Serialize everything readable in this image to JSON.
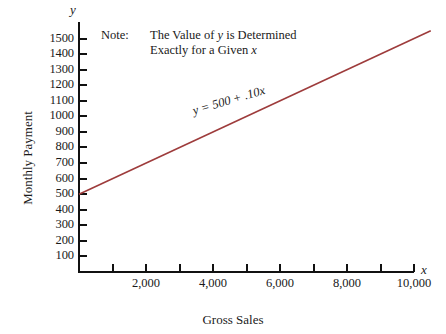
{
  "chart_data": {
    "type": "line",
    "title": "",
    "xlabel": "Gross Sales",
    "ylabel": "Monthly Payment",
    "x_variable": "x",
    "y_variable": "y",
    "xlim": [
      0,
      11000
    ],
    "ylim": [
      0,
      1550
    ],
    "grid": false,
    "legend": "none",
    "x_ticks": [
      1000,
      2000,
      3000,
      4000,
      5000,
      6000,
      7000,
      8000,
      9000,
      10000
    ],
    "x_tick_labels": [
      "",
      "2,000",
      "",
      "4,000",
      "",
      "6,000",
      "",
      "8,000",
      "",
      "10,000"
    ],
    "y_ticks": [
      100,
      200,
      300,
      400,
      500,
      600,
      700,
      800,
      900,
      1000,
      1100,
      1200,
      1300,
      1400,
      1500
    ],
    "y_tick_labels": [
      "100",
      "200",
      "300",
      "400",
      "500",
      "600",
      "700",
      "800",
      "900",
      "1000",
      "1100",
      "1200",
      "1300",
      "1400",
      "1500"
    ],
    "series": [
      {
        "name": "y = 500 + .10x",
        "equation_label": "y = 500 + .10x",
        "intercept": 500,
        "slope": 0.1,
        "color": "#9e3c3c",
        "x": [
          0,
          10500
        ],
        "values": [
          500,
          1550
        ]
      }
    ],
    "annotations": [
      {
        "name": "note",
        "label": "Note:",
        "line1_pre": "The Value of ",
        "line1_var": "y",
        "line1_post": " is Determined",
        "line2_pre": "Exactly for a Given ",
        "line2_var": "x",
        "line2_post": ""
      }
    ]
  }
}
